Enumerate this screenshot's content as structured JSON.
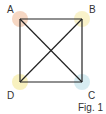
{
  "figure": {
    "caption": "Fig. 1",
    "vertices": [
      {
        "label": "A",
        "x": 20,
        "y": 19,
        "color": "#f5d3bd"
      },
      {
        "label": "B",
        "x": 82,
        "y": 19,
        "color": "#f8f1c4"
      },
      {
        "label": "C",
        "x": 82,
        "y": 82,
        "color": "#d3eaf0"
      },
      {
        "label": "D",
        "x": 20,
        "y": 82,
        "color": "#f7efb8"
      }
    ],
    "edges": [
      [
        "A",
        "B"
      ],
      [
        "B",
        "C"
      ],
      [
        "C",
        "D"
      ],
      [
        "D",
        "A"
      ],
      [
        "A",
        "C"
      ],
      [
        "B",
        "D"
      ]
    ],
    "line_color": "#222222"
  }
}
